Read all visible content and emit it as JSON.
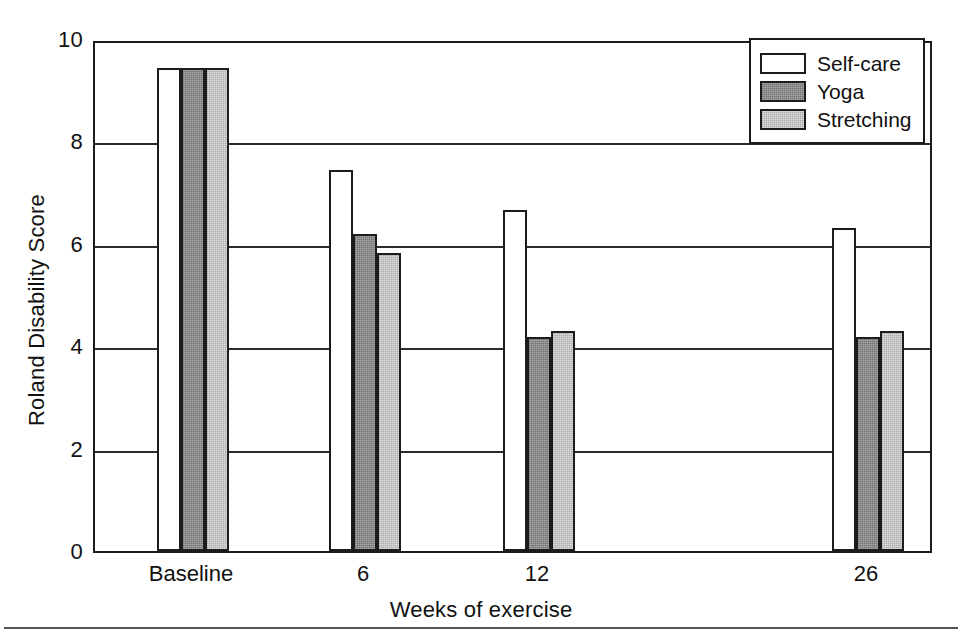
{
  "chart_data": {
    "type": "bar",
    "title": "",
    "xlabel": "Weeks of exercise",
    "ylabel": "Roland Disability Score",
    "categories": [
      "Baseline",
      "6",
      "12",
      "26"
    ],
    "ylim": [
      0,
      10
    ],
    "yticks": [
      "0",
      "2",
      "4",
      "6",
      "8",
      "10"
    ],
    "ytick_values": [
      0,
      2,
      4,
      6,
      8,
      10
    ],
    "grid": "horizontal",
    "legend_position": "top-right",
    "series": [
      {
        "name": "Self-care",
        "color": "#ffffff",
        "values": [
          9.43,
          7.44,
          6.66,
          6.31
        ]
      },
      {
        "name": "Yoga",
        "color": "#8a8a8a",
        "values": [
          9.43,
          6.19,
          4.17,
          4.17
        ]
      },
      {
        "name": "Stretching",
        "color": "#c6c6c6",
        "values": [
          9.43,
          5.83,
          4.3,
          4.3
        ]
      }
    ]
  }
}
